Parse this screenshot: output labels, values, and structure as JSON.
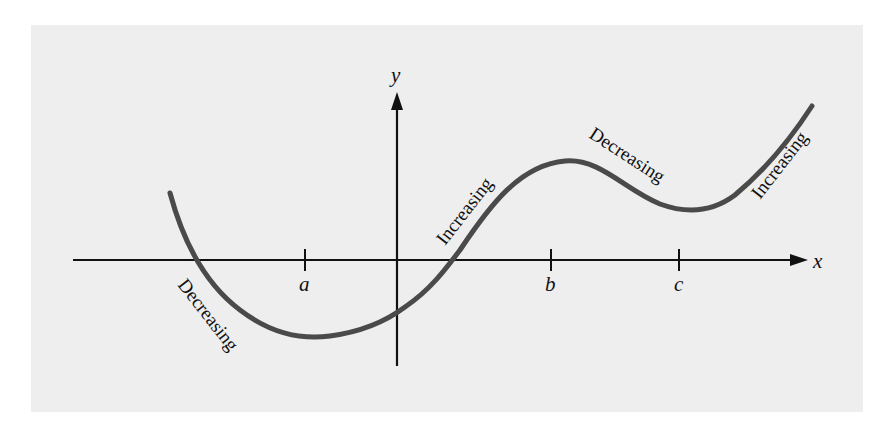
{
  "figure": {
    "axes": {
      "x_label": "x",
      "y_label": "y"
    },
    "ticks": [
      {
        "label": "a",
        "role": "local minimum"
      },
      {
        "label": "b",
        "role": "local maximum"
      },
      {
        "label": "c",
        "role": "local minimum"
      }
    ],
    "curve_labels": [
      {
        "text": "Decreasing",
        "segment": "left of a"
      },
      {
        "text": "Increasing",
        "segment": "between a and b"
      },
      {
        "text": "Decreasing",
        "segment": "between b and c"
      },
      {
        "text": "Increasing",
        "segment": "right of c"
      }
    ],
    "colors": {
      "background": "#eeeeee",
      "axis": "#111111",
      "curve": "#4a4a4a"
    }
  }
}
